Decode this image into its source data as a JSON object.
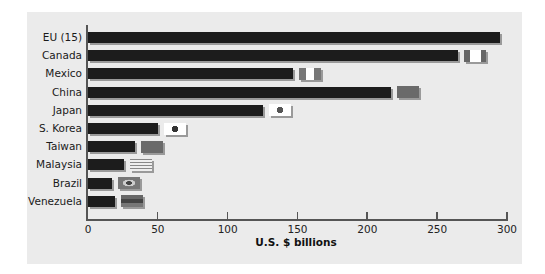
{
  "chart_data": {
    "type": "bar",
    "orientation": "horizontal",
    "title": "",
    "xlabel": "U.S. $ billions",
    "ylabel": "",
    "xlim": [
      0,
      300
    ],
    "xticks": [
      0,
      50,
      100,
      150,
      200,
      250,
      300
    ],
    "grid": false,
    "legend": null,
    "categories": [
      "EU (15)",
      "Canada",
      "Mexico",
      "China",
      "Japan",
      "S. Korea",
      "Taiwan",
      "Malaysia",
      "Brazil",
      "Venezuela"
    ],
    "values": [
      295,
      265,
      147,
      217,
      125,
      50,
      34,
      26,
      17,
      19
    ],
    "annotations": [
      "country flag icons at bar ends (except EU)"
    ]
  },
  "axis": {
    "ticks": [
      "0",
      "50",
      "100",
      "150",
      "200",
      "250",
      "300"
    ],
    "xlabel": "U.S. $ billions"
  },
  "rows": [
    {
      "label": "EU (15)",
      "flag": "none"
    },
    {
      "label": "Canada",
      "flag": "canada-flag"
    },
    {
      "label": "Mexico",
      "flag": "mexico-flag"
    },
    {
      "label": "China",
      "flag": "china-flag"
    },
    {
      "label": "Japan",
      "flag": "japan-flag"
    },
    {
      "label": "S. Korea",
      "flag": "south-korea-flag"
    },
    {
      "label": "Taiwan",
      "flag": "taiwan-flag"
    },
    {
      "label": "Malaysia",
      "flag": "malaysia-flag"
    },
    {
      "label": "Brazil",
      "flag": "brazil-flag"
    },
    {
      "label": "Venezuela",
      "flag": "venezuela-flag"
    }
  ],
  "colors": {
    "bar": "#1c1c1c",
    "background": "#ebebeb",
    "shadow": "#9a9a9a"
  }
}
